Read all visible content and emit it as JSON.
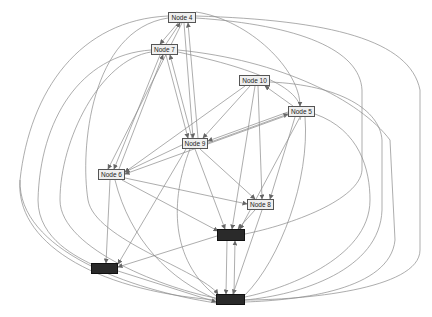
{
  "diagram": {
    "type": "directed-graph",
    "nodes": [
      {
        "id": "n4",
        "label": "Node 4",
        "style": "light",
        "x": 168,
        "y": 12,
        "w": 28,
        "h": 11
      },
      {
        "id": "n7",
        "label": "Node 7",
        "style": "light",
        "x": 151,
        "y": 44,
        "w": 27,
        "h": 11
      },
      {
        "id": "n10",
        "label": "Node 10",
        "style": "light",
        "x": 239,
        "y": 75,
        "w": 31,
        "h": 11
      },
      {
        "id": "n5",
        "label": "Node 5",
        "style": "light",
        "x": 288,
        "y": 106,
        "w": 27,
        "h": 11
      },
      {
        "id": "n9",
        "label": "Node 9",
        "style": "light",
        "x": 182,
        "y": 138,
        "w": 26,
        "h": 11
      },
      {
        "id": "n6",
        "label": "Node 6",
        "style": "light",
        "x": 98,
        "y": 169,
        "w": 27,
        "h": 11
      },
      {
        "id": "n8",
        "label": "Node 8",
        "style": "light",
        "x": 247,
        "y": 199,
        "w": 27,
        "h": 11
      },
      {
        "id": "d1",
        "label": "",
        "style": "dark",
        "x": 217,
        "y": 229,
        "w": 28,
        "h": 12
      },
      {
        "id": "d2",
        "label": "",
        "style": "dark",
        "x": 91,
        "y": 263,
        "w": 27,
        "h": 11
      },
      {
        "id": "d3",
        "label": "",
        "style": "dark",
        "x": 216,
        "y": 294,
        "w": 29,
        "h": 11
      }
    ],
    "edge_color": "#8a8a8a",
    "light_node_fill": "#efefef",
    "dark_node_fill": "#2a2a2a"
  }
}
